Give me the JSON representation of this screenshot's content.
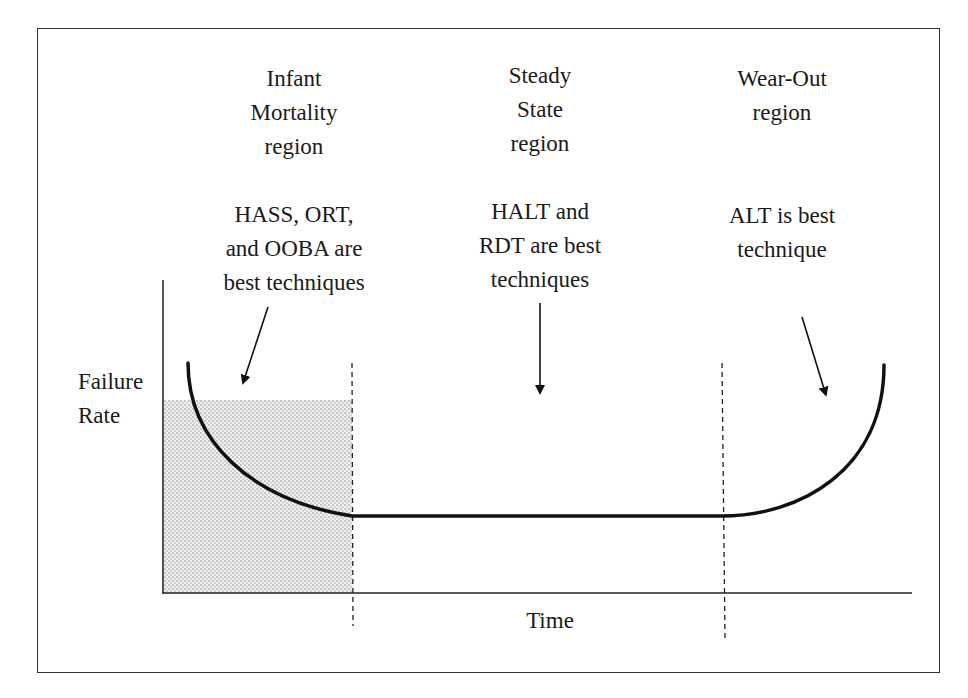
{
  "diagram": {
    "type": "bathtub-curve",
    "regions": [
      {
        "title": "Infant\nMortality\nregion",
        "technique": "HASS, ORT,\nand OOBA are\nbest techniques"
      },
      {
        "title": "Steady\nState\nregion",
        "technique": "HALT and\nRDT are best\ntechniques"
      },
      {
        "title": "Wear-Out\nregion",
        "technique": "ALT is best\ntechnique"
      }
    ],
    "y_axis_label": "Failure\nRate",
    "x_axis_label": "Time",
    "colors": {
      "line": "#111111",
      "frame": "#333333",
      "shading": "#888888"
    }
  }
}
